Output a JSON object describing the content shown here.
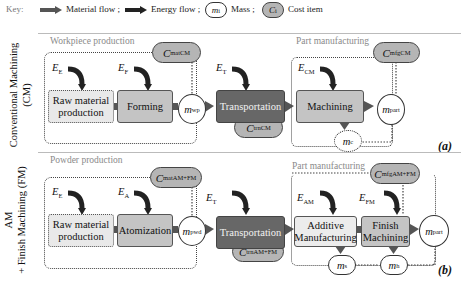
{
  "key": {
    "label": "Key:",
    "material_flow": "Material flow ;",
    "energy_flow": "Energy flow ;",
    "mass_symbol": "m",
    "mass_sub": "i",
    "mass_label": "Mass ;",
    "cost_symbol": "C",
    "cost_sub": "i",
    "cost_label": "Cost item"
  },
  "colors": {
    "material_flow": "#555555",
    "energy_flow": "#222222",
    "process_box": "#c4c4c4",
    "transport_box": "#676767",
    "cost_pill": "#b5b5b5"
  },
  "panel_a": {
    "side_label_line1": "Conventional Machining",
    "side_label_line2": "(CM)",
    "letter": "(a)",
    "workpiece_section": "Workpiece production",
    "part_section": "Part manufacturing",
    "energy": [
      {
        "sym": "E",
        "sub": "E"
      },
      {
        "sym": "E",
        "sub": "F"
      },
      {
        "sym": "E",
        "sub": "T"
      },
      {
        "sym": "E",
        "sub": "CM"
      }
    ],
    "boxes": {
      "raw_line1": "Raw material",
      "raw_line2": "production",
      "forming": "Forming",
      "transport": "Transportation",
      "machining": "Machining"
    },
    "masses": {
      "wp": {
        "sym": "m",
        "sub": "wp"
      },
      "part": {
        "sym": "m",
        "sub": "part"
      },
      "c": {
        "sym": "m",
        "sub": "c"
      }
    },
    "costs": {
      "mat": {
        "sym": "C",
        "sub": "mat",
        "sup": "CM"
      },
      "trn": {
        "sym": "C",
        "sub": "trn",
        "sup": "CM"
      },
      "mfg": {
        "sym": "C",
        "sub": "mfg",
        "sup": "CM"
      }
    }
  },
  "panel_b": {
    "side_label_line1": "AM",
    "side_label_line2": "+ Finish Machining (FM)",
    "letter": "(b)",
    "powder_section": "Powder production",
    "part_section": "Part manufacturing",
    "energy": [
      {
        "sym": "E",
        "sub": "E"
      },
      {
        "sym": "E",
        "sub": "A"
      },
      {
        "sym": "E",
        "sub": "T"
      },
      {
        "sym": "E",
        "sub": "AM"
      },
      {
        "sym": "E",
        "sub": "FM"
      }
    ],
    "boxes": {
      "raw_line1": "Raw material",
      "raw_line2": "production",
      "atomization": "Atomization",
      "transport": "Transportation",
      "am_line1": "Additive",
      "am_line2": "Manufacturing",
      "fm_line1": "Finish",
      "fm_line2": "Machining"
    },
    "masses": {
      "pwd": {
        "sym": "m",
        "sub": "pwd"
      },
      "part": {
        "sym": "m",
        "sub": "part"
      },
      "s": {
        "sym": "m",
        "sub": "s"
      },
      "h": {
        "sym": "m",
        "sub": "h"
      }
    },
    "costs": {
      "mat": {
        "sym": "C",
        "sub": "mat",
        "sup": "AM+FM"
      },
      "trn": {
        "sym": "C",
        "sub": "trn",
        "sup": "AM+FM"
      },
      "mfg": {
        "sym": "C",
        "sub": "mfg",
        "sup": "AM+FM"
      }
    }
  }
}
